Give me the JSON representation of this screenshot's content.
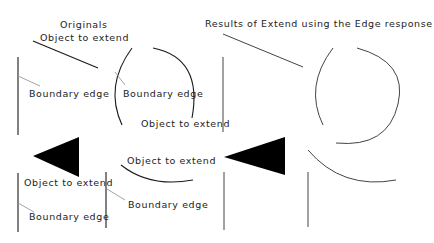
{
  "titles": {
    "originals": "Originals",
    "results": "Results of Extend using the Edge response"
  },
  "labels": {
    "object_to_extend": "Object to extend",
    "boundary_edge": "Boundary edge"
  },
  "colors": {
    "object_stroke": "#1a1a1a",
    "leader_stroke": "#9a9a9a",
    "fill": "#000000"
  },
  "diagram": {
    "panels": [
      {
        "name": "originals",
        "examples": [
          "line-to-line",
          "arc-to-circle",
          "triangle-to-line",
          "arc-to-line"
        ]
      },
      {
        "name": "results",
        "examples": [
          "line-to-line",
          "arc-to-circle",
          "triangle-to-line",
          "arc-to-line"
        ]
      }
    ]
  }
}
